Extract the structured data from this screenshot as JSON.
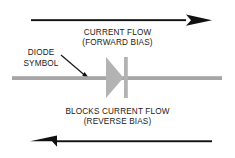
{
  "diagram": {
    "colors": {
      "arrow_black": "#111111",
      "wire_gray": "#a6a6a6",
      "diode_gray": "#b3b3b3",
      "text_black": "#1a1a1a",
      "background": "#ffffff"
    },
    "forward": {
      "line1": "CURRENT FLOW",
      "line2": "(FORWARD BIAS)",
      "arrow_direction": "right"
    },
    "reverse": {
      "line1": "BLOCKS CURRENT FLOW",
      "line2": "(REVERSE BIAS)",
      "arrow_direction": "left"
    },
    "callout": {
      "line1": "DIODE",
      "line2": "SYMBOL",
      "pointer": "leader-arrow-to-diode"
    }
  }
}
